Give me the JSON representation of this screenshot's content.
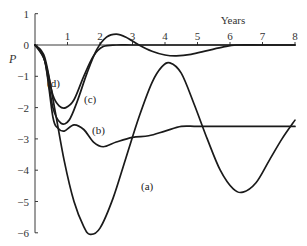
{
  "chart_data": {
    "type": "line",
    "title": "",
    "xlabel": "Years",
    "ylabel": "P",
    "xlim": [
      0,
      8
    ],
    "ylim": [
      -6,
      1
    ],
    "grid": false,
    "legend": "inline labels (a), (b), (c), (d)",
    "x_ticks": [
      "1",
      "2",
      "3",
      "4",
      "5",
      "6",
      "7",
      "8"
    ],
    "y_ticks": [
      "1",
      "0",
      "-1",
      "-2",
      "-3",
      "-4",
      "-5",
      "-6"
    ],
    "series": [
      {
        "name": "(a)",
        "x": [
          0,
          0.3,
          0.6,
          0.9,
          1.2,
          1.5,
          1.7,
          2.0,
          2.4,
          2.8,
          3.2,
          3.6,
          3.9,
          4.15,
          4.5,
          4.9,
          5.3,
          5.7,
          6.1,
          6.4,
          6.8,
          7.2,
          7.6,
          8.0
        ],
        "y": [
          0,
          -0.4,
          -2.0,
          -3.7,
          -5.0,
          -5.8,
          -6.05,
          -5.85,
          -4.9,
          -3.6,
          -2.3,
          -1.2,
          -0.7,
          -0.57,
          -0.9,
          -1.9,
          -3.0,
          -4.0,
          -4.6,
          -4.7,
          -4.4,
          -3.7,
          -3.0,
          -2.4
        ]
      },
      {
        "name": "(b)",
        "x": [
          0,
          0.3,
          0.55,
          0.7,
          0.9,
          1.2,
          1.5,
          1.8,
          2.1,
          2.5,
          3.0,
          3.5,
          4.0,
          4.5,
          5.0,
          6.0,
          7.0,
          8.0
        ],
        "y": [
          0,
          -0.5,
          -2.3,
          -2.65,
          -2.75,
          -2.55,
          -2.7,
          -3.1,
          -3.25,
          -3.1,
          -2.95,
          -2.9,
          -2.75,
          -2.6,
          -2.6,
          -2.6,
          -2.6,
          -2.6
        ]
      },
      {
        "name": "(c)",
        "x": [
          0,
          0.3,
          0.55,
          0.8,
          1.05,
          1.3,
          1.6,
          1.9,
          2.2,
          2.5,
          2.8,
          3.2,
          3.6,
          4.0,
          4.35,
          4.8,
          5.3,
          5.8,
          6.2,
          7.0,
          8.0
        ],
        "y": [
          0,
          -0.5,
          -2.0,
          -2.5,
          -2.4,
          -1.8,
          -0.9,
          -0.15,
          0.25,
          0.35,
          0.25,
          0.0,
          -0.2,
          -0.32,
          -0.35,
          -0.3,
          -0.18,
          -0.06,
          0.0,
          0.0,
          0.0
        ]
      },
      {
        "name": "(d)",
        "x": [
          0,
          0.3,
          0.55,
          0.75,
          0.95,
          1.2,
          1.5,
          1.8,
          2.1,
          2.5,
          3.0,
          4.0,
          5.0,
          6.0,
          7.0,
          8.0
        ],
        "y": [
          0,
          -0.5,
          -1.6,
          -1.95,
          -2.0,
          -1.75,
          -1.0,
          -0.35,
          -0.05,
          0.0,
          0.0,
          0.0,
          0.0,
          0.0,
          0.0,
          0.0
        ]
      }
    ]
  },
  "plot": {
    "px": {
      "x0": 35,
      "xPerUnit": 32.5,
      "y0": 45,
      "yPerUnit": 31.3
    }
  }
}
